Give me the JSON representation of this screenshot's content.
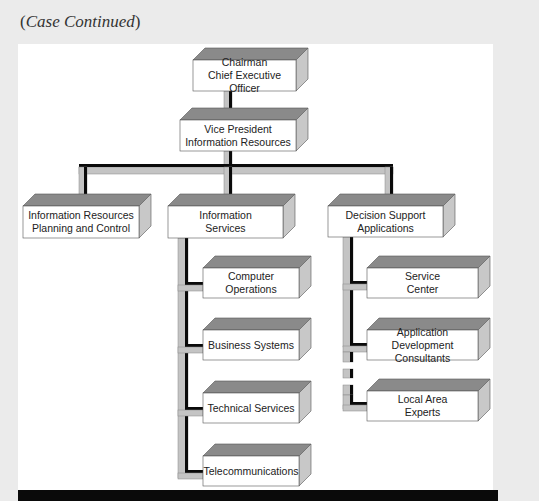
{
  "caption": {
    "open": "(",
    "text": "Case Continued",
    "close": ")"
  },
  "colors": {
    "top_face": "#8a8a8a",
    "side_face": "#c8c8c8",
    "front_face": "#ffffff",
    "connector_fill": "#c4c4c4",
    "connector_shadow": "#0a0a0a",
    "outline": "#555555"
  },
  "org_chart": {
    "nodes": [
      {
        "id": "ceo",
        "lines": [
          "Chairman",
          "Chief Executive Officer"
        ],
        "parent": null
      },
      {
        "id": "vp",
        "lines": [
          "Vice President",
          "Information Resources"
        ],
        "parent": "ceo"
      },
      {
        "id": "irpc",
        "lines": [
          "Information Resources",
          "Planning and Control"
        ],
        "parent": "vp"
      },
      {
        "id": "is",
        "lines": [
          "Information",
          "Services"
        ],
        "parent": "vp"
      },
      {
        "id": "dsa",
        "lines": [
          "Decision Support",
          "Applications"
        ],
        "parent": "vp"
      },
      {
        "id": "co",
        "lines": [
          "Computer Operations"
        ],
        "parent": "is"
      },
      {
        "id": "bs",
        "lines": [
          "Business Systems"
        ],
        "parent": "is"
      },
      {
        "id": "ts",
        "lines": [
          "Technical Services"
        ],
        "parent": "is"
      },
      {
        "id": "tc",
        "lines": [
          "Telecommunications"
        ],
        "parent": "is"
      },
      {
        "id": "sc",
        "lines": [
          "Service",
          "Center"
        ],
        "parent": "dsa"
      },
      {
        "id": "adc",
        "lines": [
          "Application Development",
          "Consultants"
        ],
        "parent": "dsa"
      },
      {
        "id": "lae",
        "lines": [
          "Local Area",
          "Experts"
        ],
        "parent": "dsa",
        "connection": "dashed"
      }
    ]
  }
}
